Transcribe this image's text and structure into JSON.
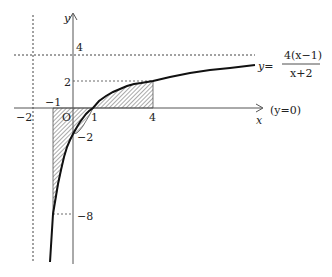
{
  "diagram": {
    "type": "function-graph",
    "function_label": {
      "lhs": "y=",
      "numerator": "4(x−1)",
      "denominator": "x+2"
    },
    "axes": {
      "x_label": "x",
      "y_label": "y",
      "x_axis_note": "(y=0)",
      "origin_label": "O"
    },
    "tick_labels": {
      "x_neg2": "−2",
      "x_neg1": "−1",
      "x_1": "1",
      "x_4": "4",
      "y_4": "4",
      "y_2": "2",
      "y_neg2": "−2",
      "y_neg8": "−8"
    },
    "asymptotes": {
      "vertical": "x=−2",
      "horizontal": "y=4"
    },
    "shaded_regions": [
      {
        "from_x": -1,
        "to_x": 1,
        "side": "below x-axis"
      },
      {
        "from_x": 1,
        "to_x": 4,
        "side": "above x-axis"
      }
    ],
    "colors": {
      "curve": "#111111",
      "axis": "#555555",
      "dashed": "#444444",
      "hatch": "#555555"
    }
  }
}
